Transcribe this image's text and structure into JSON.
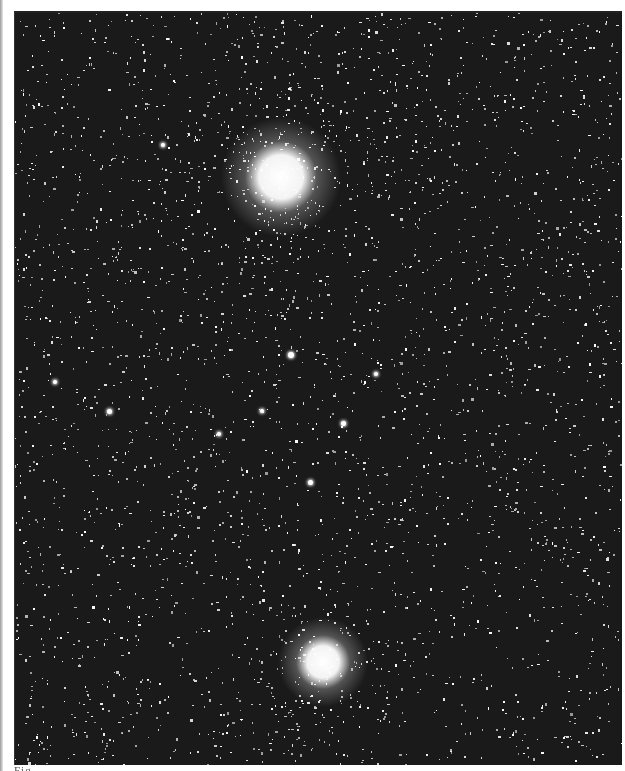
{
  "image": {
    "subject": "star-field-photographic-plate",
    "style": "grainy black-and-white astronomical photograph",
    "colors": {
      "background": "#1a1a1a",
      "stars": "#ffffff",
      "page": "#ffffff"
    },
    "plate_bounds": {
      "x": 14,
      "y": 11,
      "width": 607,
      "height": 752
    },
    "clusters": [
      {
        "name": "upper-bright-cluster",
        "x": 280,
        "y": 175,
        "core_radius": 22,
        "halo_radius": 60
      },
      {
        "name": "lower-bright-cluster",
        "x": 322,
        "y": 660,
        "core_radius": 16,
        "halo_radius": 45
      }
    ],
    "bright_stars": [
      {
        "x": 290,
        "y": 353,
        "r": 3
      },
      {
        "x": 108,
        "y": 409,
        "r": 2.5
      },
      {
        "x": 342,
        "y": 421,
        "r": 2.5
      },
      {
        "x": 218,
        "y": 432,
        "r": 2
      },
      {
        "x": 309,
        "y": 480,
        "r": 2.5
      },
      {
        "x": 162,
        "y": 143,
        "r": 2
      },
      {
        "x": 54,
        "y": 380,
        "r": 2
      },
      {
        "x": 375,
        "y": 372,
        "r": 2
      },
      {
        "x": 261,
        "y": 409,
        "r": 2
      }
    ]
  },
  "caption": {
    "text": "Fig. ...",
    "visible": "truncated"
  }
}
